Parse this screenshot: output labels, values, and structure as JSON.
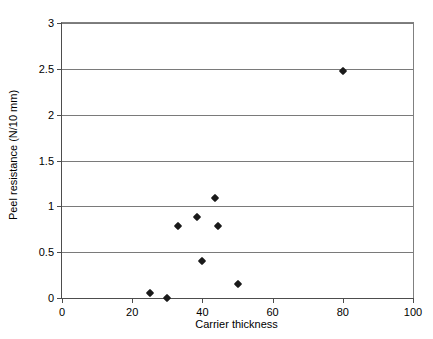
{
  "chart_data": {
    "type": "scatter",
    "title": "",
    "xlabel": "Carrier thickness",
    "ylabel": "Peel resistance (N/10 mm)",
    "xlim": [
      0,
      100
    ],
    "ylim": [
      0,
      3
    ],
    "xticks": [
      0,
      20,
      40,
      60,
      80,
      100
    ],
    "xtick_labels": [
      "0",
      "20",
      "40",
      "60",
      "80",
      "100"
    ],
    "yticks": [
      0,
      0.5,
      1,
      1.5,
      2,
      2.5,
      3
    ],
    "ytick_labels": [
      "0",
      "0.5",
      "1",
      "1.5",
      "2",
      "2.5",
      "3"
    ],
    "grid": "horizontal",
    "legend": null,
    "marker": "diamond",
    "marker_color": "#1a1a1a",
    "points": [
      {
        "x": 25,
        "y": 0.05
      },
      {
        "x": 30,
        "y": 0.0
      },
      {
        "x": 33,
        "y": 0.79
      },
      {
        "x": 38.5,
        "y": 0.88
      },
      {
        "x": 40,
        "y": 0.4
      },
      {
        "x": 43.5,
        "y": 1.09
      },
      {
        "x": 44.5,
        "y": 0.79
      },
      {
        "x": 50,
        "y": 0.15
      },
      {
        "x": 80,
        "y": 2.48
      }
    ]
  }
}
